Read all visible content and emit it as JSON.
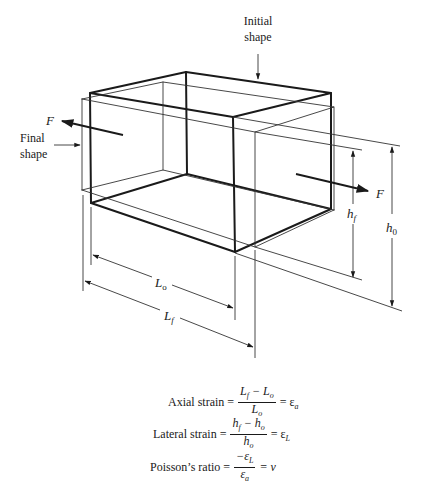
{
  "labels": {
    "initial_shape": [
      "Initial",
      "shape"
    ],
    "final_shape": [
      "Final",
      "shape"
    ],
    "force_left": "F",
    "force_right": "F",
    "h_f": {
      "base": "h",
      "sub": "f"
    },
    "h_0": {
      "base": "h",
      "sub": "0"
    },
    "L_o": {
      "base": "L",
      "sub": "o"
    },
    "L_f": {
      "base": "L",
      "sub": "f"
    }
  },
  "equations": [
    {
      "name": "Axial strain",
      "label": "Axial strain =",
      "numerator": "Lₐ",
      "num_html": [
        "L",
        "f",
        " − L",
        "o"
      ],
      "denominator": [
        "L",
        "o"
      ],
      "result": [
        "= ε",
        "a"
      ]
    },
    {
      "name": "Lateral strain",
      "label": "Lateral strain =",
      "num_html": [
        "h",
        "f",
        " − h",
        "o"
      ],
      "denominator": [
        "h",
        "o"
      ],
      "result": [
        "= ε",
        "L"
      ]
    },
    {
      "name": "Poisson's ratio",
      "label": "Poisson’s ratio =",
      "num_html": [
        "−ε",
        "L"
      ],
      "denominator": [
        "ε",
        "a"
      ],
      "result": [
        "= ν",
        ""
      ]
    }
  ]
}
